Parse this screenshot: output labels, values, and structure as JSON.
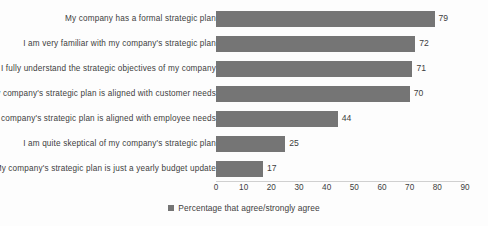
{
  "chart_data": {
    "type": "bar",
    "orientation": "horizontal",
    "title": "",
    "xlabel": "",
    "ylabel": "",
    "xlim": [
      0,
      90
    ],
    "xticks": [
      0,
      10,
      20,
      30,
      40,
      50,
      60,
      70,
      80,
      90
    ],
    "grid": false,
    "legend_position": "bottom",
    "categories": [
      "My company has a formal strategic plan",
      "I am very familiar with my company's strategic plan",
      "I fully understand the strategic objectives of my company",
      "My company's strategic plan is aligned with customer needs",
      "My company's strategic plan is aligned with employee needs",
      "I am quite skeptical of my company's strategic plan",
      "My company's strategic plan is just a yearly budget update"
    ],
    "values": [
      79,
      72,
      71,
      70,
      44,
      25,
      17
    ],
    "series": [
      {
        "name": "Percentage that agree/strongly agree",
        "values": [
          79,
          72,
          71,
          70,
          44,
          25,
          17
        ],
        "color": "#757575"
      }
    ],
    "legend": [
      "Percentage that agree/strongly agree"
    ],
    "data_labels": [
      "79",
      "72",
      "71",
      "70",
      "44",
      "25",
      "17"
    ],
    "tick_labels": [
      "0",
      "10",
      "20",
      "30",
      "40",
      "50",
      "60",
      "70",
      "80",
      "90"
    ]
  },
  "colors": {
    "bar": "#757575",
    "text": "#3d3d3d",
    "axis": "#d0d0d0",
    "background": "#fdfdfd"
  }
}
